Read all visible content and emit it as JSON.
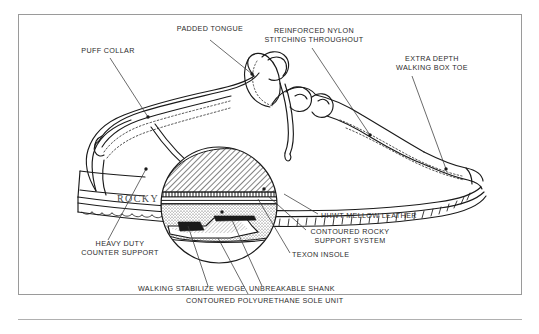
{
  "diagram": {
    "brand_mark": "ROCKY",
    "line_color": "#1a1a1a",
    "text_color": "#2b2b2b",
    "frame_color": "#9a9a9a",
    "background": "#ffffff"
  },
  "callouts": [
    {
      "id": "padded-tongue",
      "lines": [
        "PADDED TONGUE"
      ]
    },
    {
      "id": "puff-collar",
      "lines": [
        "PUFF COLLAR"
      ]
    },
    {
      "id": "reinforced-nylon",
      "lines": [
        "REINFORCED NYLON",
        "STITCHING THROUGHOUT"
      ]
    },
    {
      "id": "extra-depth-box-toe",
      "lines": [
        "EXTRA DEPTH",
        "WALKING BOX TOE"
      ]
    },
    {
      "id": "hhwt-mellow-leather",
      "lines": [
        "HHWT MELLOW LEATHER"
      ]
    },
    {
      "id": "contoured-rocky",
      "lines": [
        "CONTOURED ROCKY",
        "SUPPORT SYSTEM"
      ]
    },
    {
      "id": "texon-insole",
      "lines": [
        "TEXON INSOLE"
      ]
    },
    {
      "id": "heavy-duty-counter",
      "lines": [
        "HEAVY DUTY",
        "COUNTER SUPPORT"
      ]
    },
    {
      "id": "walking-stabilize",
      "lines": [
        "WALKING STABILIZE WEDGE"
      ]
    },
    {
      "id": "unbreakable-shank",
      "lines": [
        "UNBREAKABLE SHANK"
      ]
    },
    {
      "id": "polyurethane-sole",
      "lines": [
        "CONTOURED POLYURETHANE SOLE UNIT"
      ]
    }
  ],
  "labels": {
    "padded_tongue_l1": "PADDED TONGUE",
    "puff_collar_l1": "PUFF COLLAR",
    "reinforced_nylon_l1": "REINFORCED NYLON",
    "reinforced_nylon_l2": "STITCHING THROUGHOUT",
    "extra_depth_l1": "EXTRA DEPTH",
    "extra_depth_l2": "WALKING BOX TOE",
    "hhwt_l1": "HHWT MELLOW LEATHER",
    "contoured_rocky_l1": "CONTOURED ROCKY",
    "contoured_rocky_l2": "SUPPORT SYSTEM",
    "texon_l1": "TEXON INSOLE",
    "heavy_duty_l1": "HEAVY DUTY",
    "heavy_duty_l2": "COUNTER SUPPORT",
    "walking_wedge_l1": "WALKING STABILIZE WEDGE",
    "unbreakable_shank_l1": "UNBREAKABLE SHANK",
    "polyurethane_l1": "CONTOURED POLYURETHANE SOLE UNIT",
    "brand": "ROCKY"
  }
}
